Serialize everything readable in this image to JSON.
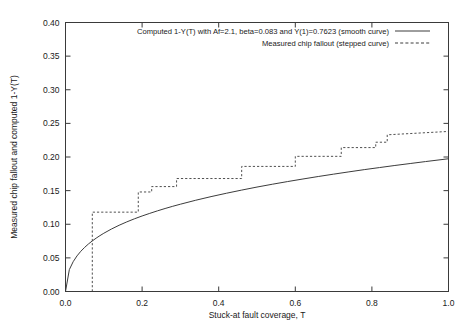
{
  "chart_data": {
    "type": "line",
    "title": "",
    "xlabel": "Stuck-at fault coverage, T",
    "ylabel": "Measured chip fallout and computed 1-Y(T)",
    "xlim": [
      0.0,
      1.0
    ],
    "ylim": [
      0.0,
      0.4
    ],
    "xticks": [
      "0.0",
      "0.2",
      "0.4",
      "0.6",
      "0.8",
      "1.0"
    ],
    "xtick_values": [
      0.0,
      0.2,
      0.4,
      0.6,
      0.8,
      1.0
    ],
    "yticks": [
      "0.00",
      "0.05",
      "0.10",
      "0.15",
      "0.20",
      "0.25",
      "0.30",
      "0.35",
      "0.40"
    ],
    "ytick_values": [
      0.0,
      0.05,
      0.1,
      0.15,
      0.2,
      0.25,
      0.3,
      0.35,
      0.4
    ],
    "grid": false,
    "legend_position": "top-center",
    "legend": [
      {
        "label": "Computed 1-Y(T) with Af=2.1, beta=0.083 and Y(1)=0.7623 (smooth curve)",
        "style": "solid",
        "color": "#3c3c3c"
      },
      {
        "label": "Measured chip fallout (stepped curve)",
        "style": "dashed",
        "color": "#3c3c3c"
      }
    ],
    "series": [
      {
        "name": "Computed 1-Y(T) with Af=2.1, beta=0.083 and Y(1)=0.7623 (smooth curve)",
        "type": "line",
        "style": "solid",
        "x": [
          0.0,
          0.01,
          0.02,
          0.03,
          0.04,
          0.05,
          0.06,
          0.07,
          0.08,
          0.09,
          0.1,
          0.12,
          0.14,
          0.16,
          0.18,
          0.2,
          0.22,
          0.24,
          0.26,
          0.28,
          0.3,
          0.34,
          0.38,
          0.42,
          0.46,
          0.5,
          0.54,
          0.58,
          0.62,
          0.66,
          0.7,
          0.74,
          0.78,
          0.82,
          0.86,
          0.9,
          0.94,
          0.97,
          1.0
        ],
        "y": [
          0.0,
          0.0325,
          0.0443,
          0.0529,
          0.0598,
          0.0656,
          0.0707,
          0.0752,
          0.0793,
          0.0831,
          0.0866,
          0.0929,
          0.0985,
          0.1035,
          0.1081,
          0.1123,
          0.1162,
          0.1199,
          0.1234,
          0.1267,
          0.1298,
          0.1357,
          0.1411,
          0.1461,
          0.1508,
          0.1553,
          0.1595,
          0.1635,
          0.1673,
          0.171,
          0.1745,
          0.1779,
          0.1812,
          0.1843,
          0.1874,
          0.1903,
          0.1932,
          0.1953,
          0.1974
        ]
      },
      {
        "name": "Measured chip fallout (stepped curve)",
        "type": "step",
        "style": "dashed",
        "x": [
          0.07,
          0.07,
          0.19,
          0.19,
          0.225,
          0.225,
          0.29,
          0.29,
          0.46,
          0.46,
          0.6,
          0.6,
          0.72,
          0.72,
          0.81,
          0.81,
          0.84,
          0.84,
          1.0
        ],
        "y": [
          0.0,
          0.118,
          0.118,
          0.148,
          0.148,
          0.156,
          0.156,
          0.168,
          0.168,
          0.186,
          0.186,
          0.201,
          0.201,
          0.214,
          0.214,
          0.222,
          0.222,
          0.233,
          0.238
        ]
      }
    ]
  },
  "figure": {
    "background": "#ffffff",
    "axis_color": "#3a3a3a",
    "line_color": "#3c3c3c"
  }
}
